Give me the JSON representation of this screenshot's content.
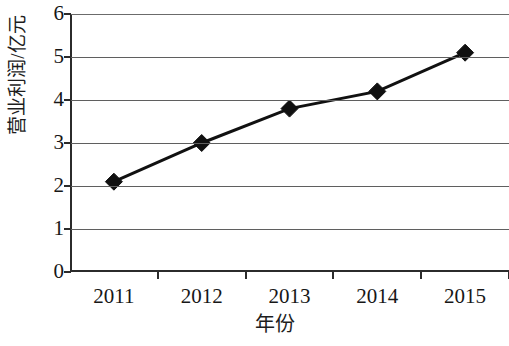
{
  "chart_data": {
    "type": "line",
    "title": "",
    "subtitle": "",
    "xlabel": "年份",
    "ylabel": "营业利润/亿元",
    "categories": [
      "2011",
      "2012",
      "2013",
      "2014",
      "2015"
    ],
    "values": [
      2.1,
      3.0,
      3.8,
      4.2,
      5.1
    ],
    "series": [
      {
        "name": "营业利润",
        "values": [
          2.1,
          3.0,
          3.8,
          4.2,
          5.1
        ]
      }
    ],
    "ylim": [
      0,
      6
    ],
    "y_ticks": [
      "0",
      "1",
      "2",
      "3",
      "4",
      "5",
      "6"
    ],
    "y_tick_values": [
      0,
      1,
      2,
      3,
      4,
      5,
      6
    ],
    "grid": "horizontal",
    "legend": "none",
    "marker": "diamond",
    "colors": {
      "line": "#111111",
      "marker": "#101010",
      "gridline": "#5f5f5f",
      "axis": "#2b2b2b",
      "text": "#171717",
      "background": "#ffffff"
    }
  }
}
